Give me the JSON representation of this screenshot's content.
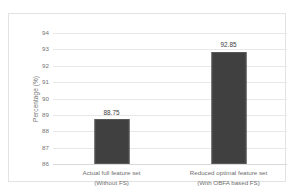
{
  "chart_data": {
    "type": "bar",
    "title": "",
    "xlabel": "",
    "ylabel": "Percentage (%)",
    "ylim": [
      86,
      94
    ],
    "ytick_step": 1,
    "yticks": [
      "94",
      "93",
      "92",
      "91",
      "90",
      "89",
      "88",
      "87",
      "86"
    ],
    "grid": true,
    "legend": "none",
    "bar_color": "#404040",
    "categories": [
      "Actual full feature set\n(Without FS)",
      "Reduced optimal feature set\n(With OBFA based FS)"
    ],
    "category_lines": [
      [
        "Actual full feature set",
        "(Without FS)"
      ],
      [
        "Reduced optimal feature set",
        "(With OBFA based FS)"
      ]
    ],
    "values": [
      88.75,
      92.85
    ],
    "data_labels": [
      "88.75",
      "92.85"
    ]
  }
}
